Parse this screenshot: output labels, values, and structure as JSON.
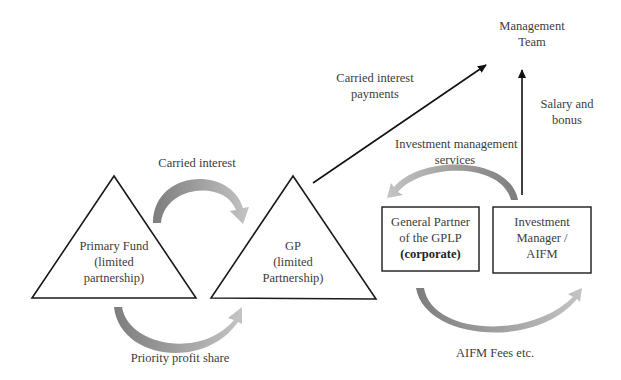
{
  "diagram": {
    "nodes": {
      "management_team": {
        "lines": [
          "Management",
          "Team"
        ]
      },
      "primary_fund": {
        "lines": [
          "Primary Fund",
          "(limited",
          "partnership)"
        ]
      },
      "gp": {
        "lines": [
          "GP",
          "(limited",
          "Partnership)"
        ]
      },
      "general_partner": {
        "lines": [
          "General Partner",
          "of the GPLP"
        ],
        "bold_line": "(corporate)"
      },
      "investment_manager": {
        "lines": [
          "Investment",
          "Manager /",
          "AIFM"
        ]
      }
    },
    "edges": {
      "carried_interest": {
        "label": "Carried interest",
        "from": "Primary Fund",
        "to": "GP"
      },
      "priority_profit_share": {
        "label": "Priority profit share",
        "from": "Primary Fund",
        "to": "GP"
      },
      "carried_interest_payments": {
        "lines": [
          "Carried interest",
          "payments"
        ],
        "from": "GP",
        "to": "Management Team"
      },
      "salary_bonus": {
        "lines": [
          "Salary and",
          "bonus"
        ],
        "from": "Investment Manager / AIFM",
        "to": "Management Team"
      },
      "investment_management_services": {
        "lines": [
          "Investment management",
          "services"
        ],
        "from": "Investment Manager / AIFM",
        "to": "General Partner of the GPLP"
      },
      "aifm_fees": {
        "label": "AIFM Fees etc.",
        "from": "General Partner of the GPLP",
        "to": "Investment Manager / AIFM"
      }
    },
    "colors": {
      "stroke": "#1a1a1a",
      "curved_arrow_dark": "#7a7a7a",
      "curved_arrow_light": "#bdbdbd",
      "text": "#3c3c3c"
    }
  }
}
